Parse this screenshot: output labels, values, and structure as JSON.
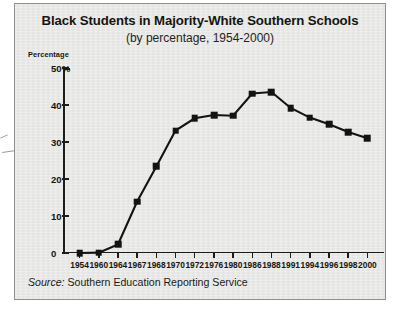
{
  "figure": {
    "title": "Black Students in Majority-White Southern Schools",
    "subtitle": "(by percentage, 1954-2000)",
    "axis_title": "Percentage",
    "source_label": "Source:",
    "source_text": "Southern Education Reporting Service",
    "panel_color": "#e9e9e7",
    "ink_color": "#131310"
  },
  "chart_data": {
    "type": "line",
    "title": "Black Students in Majority-White Southern Schools",
    "subtitle": "(by percentage, 1954-2000)",
    "xlabel": "",
    "ylabel": "Percentage",
    "ylim": [
      0,
      50
    ],
    "yticks": [
      0,
      10,
      20,
      30,
      40,
      50
    ],
    "ytick_labels": [
      "0",
      "10",
      "20",
      "30",
      "40",
      "50%"
    ],
    "grid": false,
    "legend": null,
    "categories": [
      "1954",
      "1960",
      "1964",
      "1967",
      "1968",
      "1970",
      "1972",
      "1976",
      "1980",
      "1986",
      "1988",
      "1991",
      "1994",
      "1996",
      "1998",
      "2000"
    ],
    "values": [
      0,
      0.1,
      2.3,
      13.9,
      23.4,
      33.1,
      36.4,
      37.3,
      37.1,
      43.1,
      43.5,
      39.2,
      36.6,
      34.8,
      32.7,
      31.0
    ],
    "series": [
      {
        "name": "Black students in majority-white Southern schools",
        "values": [
          0,
          0.1,
          2.3,
          13.9,
          23.4,
          33.1,
          36.4,
          37.3,
          37.1,
          43.1,
          43.5,
          39.2,
          36.6,
          34.8,
          32.7,
          31.0
        ]
      }
    ],
    "marker": "square",
    "line_color": "#131310"
  }
}
